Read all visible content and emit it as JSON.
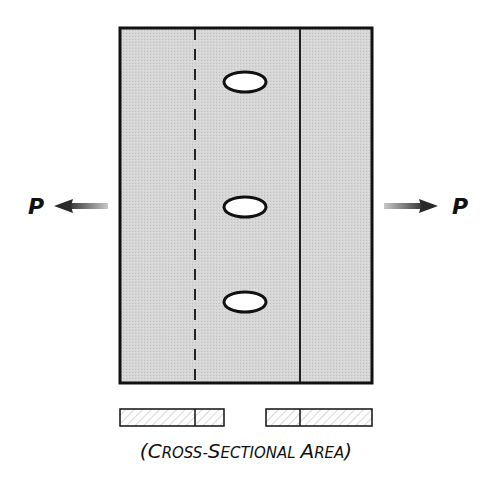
{
  "diagram": {
    "type": "bolted-plate-tension",
    "plate": {
      "fill": "#d4d4d4",
      "stroke": "#111111",
      "x": 120,
      "y": 28,
      "width": 252,
      "height": 355
    },
    "dashed_line": {
      "x": 195
    },
    "solid_line": {
      "x": 300
    },
    "holes": [
      {
        "cx": 245,
        "cy": 82,
        "rx": 21,
        "ry": 10
      },
      {
        "cx": 245,
        "cy": 207,
        "rx": 21,
        "ry": 10
      },
      {
        "cx": 245,
        "cy": 302,
        "rx": 21,
        "ry": 10
      }
    ],
    "forces": {
      "left": {
        "label": "P",
        "direction": "left"
      },
      "right": {
        "label": "P",
        "direction": "right"
      }
    },
    "cross_section": {
      "caption_open": "(",
      "caption_words": [
        {
          "initial": "C",
          "rest": "ROSS-"
        },
        {
          "initial": "S",
          "rest": "ECTIONAL "
        },
        {
          "initial": "A",
          "rest": "REA"
        }
      ],
      "caption_close": ")",
      "caption_full": "(Cross-Sectional Area)",
      "bars": [
        {
          "x": 120,
          "width": 104,
          "divider": 195
        },
        {
          "x": 266,
          "width": 106,
          "divider": 300
        }
      ]
    }
  }
}
